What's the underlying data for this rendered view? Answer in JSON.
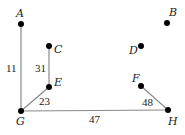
{
  "graph": {
    "colors": {
      "edge": "#8a8a8a",
      "node": "#000000",
      "text": "#222222",
      "background": "#ffffff"
    },
    "nodes": [
      {
        "id": "A",
        "label": "A",
        "x": 21,
        "y": 24,
        "lx": 16,
        "ly": 17
      },
      {
        "id": "B",
        "label": "B",
        "x": 167,
        "y": 23,
        "lx": 169,
        "ly": 16
      },
      {
        "id": "C",
        "label": "C",
        "x": 49,
        "y": 46,
        "lx": 54,
        "ly": 53
      },
      {
        "id": "D",
        "label": "D",
        "x": 141,
        "y": 46,
        "lx": 129,
        "ly": 54
      },
      {
        "id": "E",
        "label": "E",
        "x": 49,
        "y": 87,
        "lx": 54,
        "ly": 86
      },
      {
        "id": "F",
        "label": "F",
        "x": 141,
        "y": 86,
        "lx": 132,
        "ly": 82
      },
      {
        "id": "G",
        "label": "G",
        "x": 21,
        "y": 111,
        "lx": 16,
        "ly": 125
      },
      {
        "id": "H",
        "label": "H",
        "x": 168,
        "y": 110,
        "lx": 168,
        "ly": 125
      }
    ],
    "edges": [
      {
        "from": "A",
        "to": "G",
        "weight": "11",
        "wx": 6,
        "wy": 72
      },
      {
        "from": "C",
        "to": "E",
        "weight": "31",
        "wx": 35,
        "wy": 72
      },
      {
        "from": "E",
        "to": "G",
        "weight": "23",
        "wx": 39,
        "wy": 105
      },
      {
        "from": "G",
        "to": "H",
        "weight": "47",
        "wx": 89,
        "wy": 123
      },
      {
        "from": "F",
        "to": "H",
        "weight": "48",
        "wx": 142,
        "wy": 106
      }
    ]
  }
}
